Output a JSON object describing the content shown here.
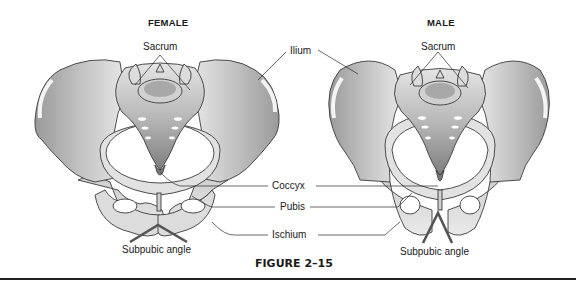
{
  "figure": {
    "caption": "FIGURE 2–15",
    "type": "anatomical comparison diagram",
    "colors": {
      "bone_light": "#e8e8e8",
      "bone_shade": "#a9a9a9",
      "bone_dark": "#7d7d7d",
      "outline": "#3a3a3a",
      "text": "#1a1a1a"
    }
  },
  "panels": [
    {
      "id": "female",
      "title": "FEMALE",
      "labels": {
        "sacrum": "Sacrum",
        "subpubic_angle": "Subpubic angle"
      }
    },
    {
      "id": "male",
      "title": "MALE",
      "labels": {
        "sacrum": "Sacrum",
        "subpubic_angle": "Subpubic angle"
      }
    }
  ],
  "shared_labels": {
    "ilium": "Ilium",
    "coccyx": "Coccyx",
    "pubis": "Pubis",
    "ischium": "Ischium"
  }
}
